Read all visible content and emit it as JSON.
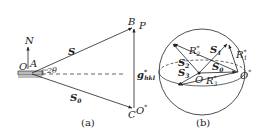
{
  "figure": {
    "panel_a": {
      "caption": "(a)",
      "labels": {
        "N": "N",
        "O": "O",
        "A": "A",
        "angle": "2θ",
        "S": "S",
        "S0_main": "S",
        "S0_sub": "0",
        "B": "B",
        "P": "P",
        "C": "C",
        "Ostar_main": "O",
        "Ostar_sup": "*",
        "g_main": "g",
        "g_sup": "*",
        "g_sub": "hkl"
      }
    },
    "panel_b": {
      "caption": "(b)",
      "labels": {
        "O": "O",
        "Ostar_main": "O",
        "Ostar_sup": "*",
        "S1_main": "S",
        "S1_sub": "1",
        "S2_main": "S",
        "S2_sub": "2",
        "S3_main": "S",
        "S3_sub": "3",
        "S0_main": "S",
        "S0_sub": "0",
        "R1_main": "R",
        "R1_sub": "1",
        "R1_sup": "*",
        "R2_main": "R",
        "R2_sub": "2",
        "R2_sup": "*",
        "R3_main": "R",
        "R3_sub": "3",
        "R3_sup": "*"
      }
    },
    "colors": {
      "line": "#222222",
      "background": "#ffffff"
    }
  }
}
